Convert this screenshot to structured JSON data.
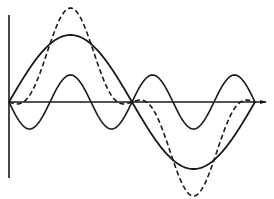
{
  "figure": {
    "width": 274,
    "height": 199,
    "background": "#ffffff",
    "stroke_color": "#1a1a1a"
  },
  "axes": {
    "origin": {
      "x": 9,
      "y": 102
    },
    "vertical": {
      "x": 9,
      "y_top": 15,
      "y_bottom": 178
    },
    "horizontal": {
      "y": 102,
      "x_start": 9,
      "x_end": 266,
      "arrow": true
    }
  },
  "waves": {
    "period_px": {
      "x_start": 9,
      "x_end": 255
    },
    "fundamental": {
      "label": "fundamental",
      "style": "solid",
      "amplitude_px": 67,
      "harmonic": 1,
      "sign": 1,
      "stroke_width": 1.8
    },
    "harmonic": {
      "label": "third harmonic",
      "style": "solid",
      "amplitude_px": 27,
      "harmonic": 3,
      "sign": -1,
      "stroke_width": 1.6
    },
    "resultant": {
      "label": "resultant (sum)",
      "style": "dashed",
      "dash": "5,3",
      "stroke_width": 1.6
    }
  }
}
